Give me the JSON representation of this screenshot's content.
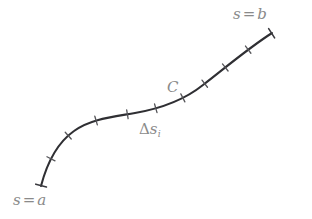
{
  "figure": {
    "kind": "line-integral-arc-length-diagram",
    "background_color": "#ffffff",
    "width": 312,
    "height": 219,
    "curve": {
      "name": "C",
      "stroke_color": "#2f2f33",
      "stroke_width": 2.1,
      "shape": "sigmoid-s-curve",
      "start_point": [
        41,
        186
      ],
      "end_point": [
        272,
        33
      ],
      "path": "M 41 186 C 47 163, 57 143, 74 131 C 90 119, 112 117, 135 113 C 158 109, 183 101, 203 85 C 224 69, 247 49, 272 33",
      "endpoint_cap_color": "#3a3a3f",
      "endpoint_cap_length": 11,
      "endpoint_cap_width": 1.6,
      "tick_color": "#555559",
      "tick_length": 9,
      "tick_width": 1.3,
      "tick_count": 9,
      "ticks_t": [
        0.1,
        0.2,
        0.31,
        0.42,
        0.52,
        0.62,
        0.71,
        0.8,
        0.9
      ]
    },
    "labels": {
      "start": {
        "text": "s = a",
        "variable": "s",
        "operator": "=",
        "value": "a",
        "color": "#8a8a8a"
      },
      "end": {
        "text": "s = b",
        "variable": "s",
        "operator": "=",
        "value": "b",
        "color": "#8a8a8a"
      },
      "curve": {
        "text": "C",
        "color": "#8a8a8a"
      },
      "segment": {
        "text": "Δs",
        "delta": "Δ",
        "variable": "s",
        "subscript": "i",
        "color": "#8a8a8a"
      }
    }
  }
}
